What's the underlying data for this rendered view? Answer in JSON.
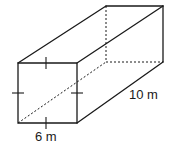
{
  "figure": {
    "type": "rectangular prism",
    "labels": {
      "side": "6 m",
      "length": "10 m"
    },
    "congruent_marks": 4,
    "colors": {
      "stroke": "#1a1a1a",
      "background": "#ffffff"
    }
  }
}
